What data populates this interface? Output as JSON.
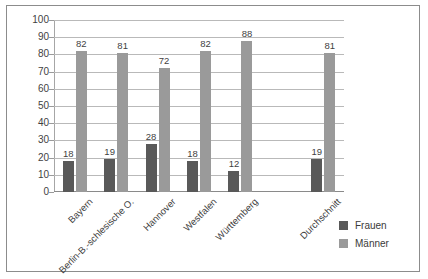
{
  "chart_data": {
    "type": "bar",
    "title": "",
    "subtitle": "",
    "xlabel": "",
    "ylabel": "",
    "ylim": [
      0,
      100
    ],
    "ytick_step": 10,
    "yticks": [
      "100",
      "90",
      "80",
      "70",
      "60",
      "50",
      "40",
      "30",
      "20",
      "10",
      "0"
    ],
    "grid": true,
    "legend_position": "bottom-right",
    "categories": [
      "Bayern",
      "Berlin-B.-schlesische O.",
      "Hannover",
      "Westfalen",
      "Württemberg",
      "Durchschnitt"
    ],
    "series": [
      {
        "name": "Frauen",
        "color": "#595959",
        "values": [
          18,
          19,
          28,
          18,
          12,
          19
        ]
      },
      {
        "name": "Männer",
        "color": "#9a9a9a",
        "values": [
          82,
          81,
          72,
          82,
          88,
          81
        ]
      }
    ],
    "data_labels": {
      "Frauen": [
        "18",
        "19",
        "28",
        "18",
        "12",
        "19"
      ],
      "Männer": [
        "82",
        "81",
        "72",
        "82",
        "88",
        "81"
      ]
    }
  },
  "legend": {
    "items": [
      {
        "label": "Frauen",
        "color": "#595959"
      },
      {
        "label": "Männer",
        "color": "#9a9a9a"
      }
    ]
  },
  "colors": {
    "frauen": "#595959",
    "manner": "#9a9a9a",
    "gridline": "#b9b9b9",
    "axis": "#8a8a8a",
    "frame": "#8c8c8c",
    "text": "#3f3f3f",
    "background": "#ffffff"
  }
}
